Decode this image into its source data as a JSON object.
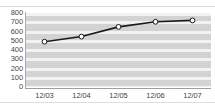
{
  "chart_data": {
    "type": "line",
    "title": "",
    "subtitle": "",
    "xlabel": "",
    "ylabel": "",
    "categories": [
      "12/03",
      "12/04",
      "12/05",
      "12/06",
      "12/07"
    ],
    "values": [
      490,
      545,
      650,
      705,
      720
    ],
    "series": [
      {
        "name": "",
        "values": [
          490,
          545,
          650,
          705,
          720
        ]
      }
    ],
    "ylim": [
      0,
      800
    ],
    "yticks": [
      800,
      700,
      600,
      500,
      400,
      300,
      200,
      100,
      0
    ],
    "ytick_labels": [
      "800",
      "700",
      "600",
      "500",
      "400",
      "300",
      "200",
      "100",
      "0"
    ],
    "xticks": [
      "12/03",
      "12/04",
      "12/05",
      "12/06",
      "12/07"
    ],
    "grid": true,
    "grid_orientation": "horizontal",
    "legend": false,
    "legend_position": "none",
    "marker": "circle-open",
    "line_color": "#1a1a1a",
    "marker_fill": "#ffffff",
    "marker_edge": "#1a1a1a",
    "plot_background": "#d3d3d3",
    "gridline_color": "#f2f2f2",
    "axis_color": "#9e9e9e",
    "tick_label_color": "#3f3f3f"
  }
}
